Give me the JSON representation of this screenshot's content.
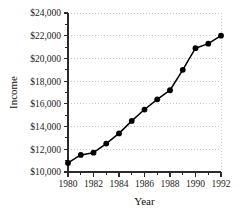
{
  "chart_data": {
    "type": "line",
    "title": "",
    "xlabel": "Year",
    "ylabel": "Income",
    "x": [
      1980,
      1981,
      1982,
      1983,
      1984,
      1985,
      1986,
      1987,
      1988,
      1989,
      1990,
      1991,
      1992
    ],
    "values": [
      10800,
      11500,
      11700,
      12500,
      13400,
      14500,
      15500,
      16400,
      17200,
      19000,
      20900,
      21300,
      22000
    ],
    "series": [
      {
        "name": "Income",
        "values": [
          10800,
          11500,
          11700,
          12500,
          13400,
          14500,
          15500,
          16400,
          17200,
          19000,
          20900,
          21300,
          22000
        ]
      }
    ],
    "xlim": [
      1980,
      1992
    ],
    "ylim": [
      10000,
      24000
    ],
    "y_tick_values": [
      10000,
      12000,
      14000,
      16000,
      18000,
      20000,
      22000,
      24000
    ],
    "y_tick_labels": [
      "$10,000",
      "$12,000",
      "$14,000",
      "$16,000",
      "$18,000",
      "$20,000",
      "$22,000",
      "$24,000"
    ],
    "x_tick_values": [
      1980,
      1982,
      1984,
      1986,
      1988,
      1990,
      1992
    ],
    "x_tick_labels": [
      "1980",
      "1982",
      "1984",
      "1986",
      "1988",
      "1990",
      "1992"
    ],
    "x_minor_tick_values": [
      1981,
      1983,
      1985,
      1987,
      1989,
      1991
    ],
    "grid": "horizontal-dotted",
    "legend": "none",
    "marker": "filled-circle",
    "line_color": "#000000",
    "marker_color": "#000000",
    "grid_color": "#b9b9b9",
    "axis_color": "#2b2b2b",
    "background_color": "#ffffff"
  },
  "axes": {
    "y_title": "Income",
    "x_title": "Year"
  }
}
